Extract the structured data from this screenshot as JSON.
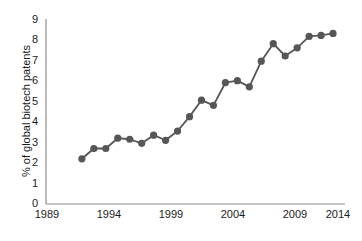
{
  "chart_data": {
    "type": "line",
    "title": "",
    "subtitle": "",
    "xlabel": "",
    "ylabel": "% of global biotech patents",
    "xlim": [
      1989,
      2014
    ],
    "ylim": [
      0,
      9
    ],
    "grid": false,
    "legend": null,
    "legend_position": "none",
    "x_ticks": [
      "1989",
      "1994",
      "1999",
      "2004",
      "2009",
      "2014"
    ],
    "x_tick_values": [
      1989,
      1994,
      1999,
      2004,
      2009,
      2014
    ],
    "y_ticks": [
      "0",
      "1",
      "2",
      "3",
      "4",
      "5",
      "6",
      "7",
      "8",
      "9"
    ],
    "y_tick_values": [
      0,
      1,
      2,
      3,
      4,
      5,
      6,
      7,
      8,
      9
    ],
    "x": [
      1992,
      1993,
      1994,
      1995,
      1996,
      1997,
      1998,
      1999,
      2000,
      2001,
      2002,
      2003,
      2004,
      2005,
      2006,
      2007,
      2008,
      2009,
      2010,
      2011,
      2012,
      2013
    ],
    "values": [
      2.2,
      2.7,
      2.7,
      3.2,
      3.15,
      2.95,
      3.35,
      3.1,
      3.55,
      4.25,
      5.05,
      4.8,
      5.9,
      6.0,
      5.7,
      6.95,
      7.8,
      7.2,
      7.6,
      8.15,
      8.2,
      8.3
    ],
    "series": [
      {
        "name": "% of global biotech patents",
        "values": [
          2.2,
          2.7,
          2.7,
          3.2,
          3.15,
          2.95,
          3.35,
          3.1,
          3.55,
          4.25,
          5.05,
          4.8,
          5.9,
          6.0,
          5.7,
          6.95,
          7.8,
          7.2,
          7.6,
          8.15,
          8.2,
          8.3
        ],
        "color": "#565656",
        "marker": "circle"
      }
    ],
    "colors": {
      "line": "#565656",
      "marker": "#565656",
      "axis": "#8c8c8c",
      "text": "#1a1a1a",
      "background": "#ffffff"
    }
  }
}
